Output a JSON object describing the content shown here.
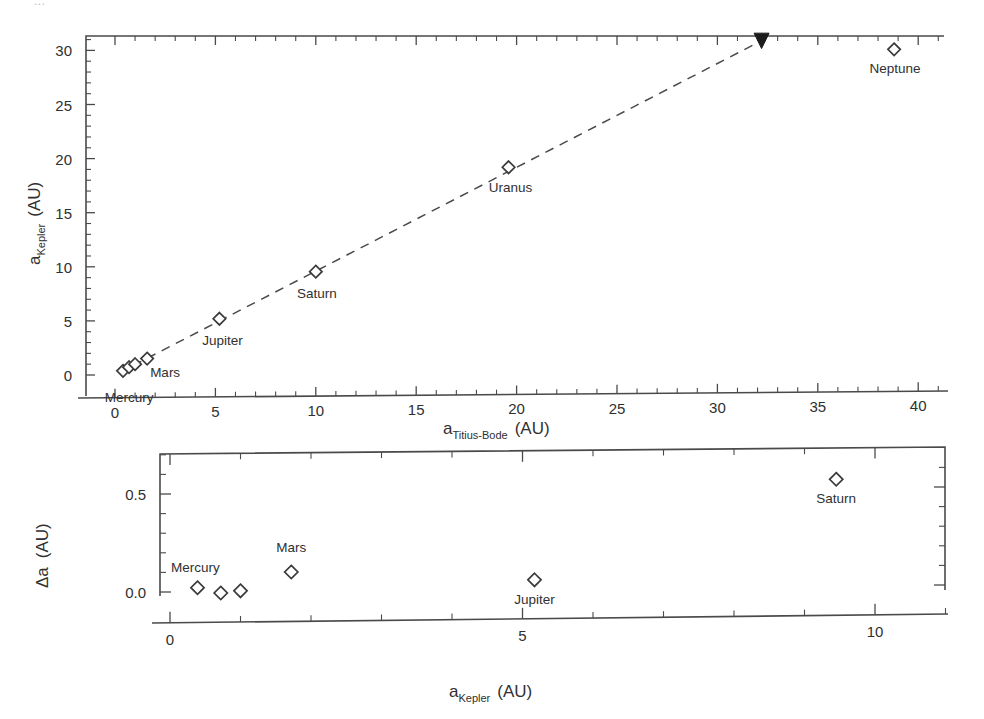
{
  "figure": {
    "scan_bleed_text": "..."
  },
  "chart_data": [
    {
      "panel": "top",
      "type": "scatter",
      "title": "",
      "xlabel": "a_Titius-Bode (AU)",
      "xlabel_base": "a",
      "xlabel_sub": "Titius-Bode",
      "xlabel_unit": "(AU)",
      "ylabel_base": "a",
      "ylabel_sub": "Kepler",
      "ylabel_unit": "(AU)",
      "xlim": [
        -1.5,
        41.5
      ],
      "ylim": [
        -2.0,
        32.5
      ],
      "xticks": [
        0,
        5,
        10,
        15,
        20,
        25,
        30,
        35,
        40
      ],
      "xticklabels": [
        "0",
        "5",
        "10",
        "15",
        "20",
        "25",
        "30",
        "35",
        "40"
      ],
      "yticks": [
        0,
        5,
        10,
        15,
        20,
        25,
        30
      ],
      "yticklabels": [
        "0",
        "5",
        "10",
        "15",
        "20",
        "25",
        "30"
      ],
      "xminor_step": 1,
      "yminor_step": 1,
      "grid": false,
      "legend": "none",
      "points": [
        {
          "label": "Mercury",
          "x": 0.4,
          "y": 0.39,
          "label_pos": "below",
          "label_show": true,
          "label_dx": 6,
          "label_dy": 31
        },
        {
          "label": "Venus",
          "x": 0.7,
          "y": 0.72,
          "label_pos": "none",
          "label_show": false,
          "label_dx": 0,
          "label_dy": 0
        },
        {
          "label": "Earth",
          "x": 1.0,
          "y": 1.0,
          "label_pos": "none",
          "label_show": false,
          "label_dx": 0,
          "label_dy": 0
        },
        {
          "label": "Mars",
          "x": 1.6,
          "y": 1.52,
          "label_pos": "below",
          "label_show": true,
          "label_dx": 18,
          "label_dy": 18
        },
        {
          "label": "Jupiter",
          "x": 5.2,
          "y": 5.2,
          "label_pos": "below",
          "label_show": true,
          "label_dx": 3,
          "label_dy": 26
        },
        {
          "label": "Saturn",
          "x": 10.0,
          "y": 9.55,
          "label_pos": "below",
          "label_show": true,
          "label_dx": 1,
          "label_dy": 26
        },
        {
          "label": "Uranus",
          "x": 19.6,
          "y": 19.2,
          "label_pos": "below",
          "label_show": true,
          "label_dx": 2,
          "label_dy": 25
        },
        {
          "label": "Neptune",
          "x": 38.8,
          "y": 30.1,
          "label_pos": "below",
          "label_show": true,
          "label_dx": 1,
          "label_dy": 24
        }
      ],
      "trend_line": {
        "x0": 0.2,
        "y0": 0.2,
        "x1": 32.2,
        "y1": 30.9,
        "style": "dashed"
      },
      "endpoint_marker": {
        "x": 32.2,
        "y": 30.9,
        "shape": "filled-down-triangle"
      }
    },
    {
      "panel": "bottom",
      "type": "scatter",
      "title": "",
      "xlabel_base": "a",
      "xlabel_sub": "Kepler",
      "xlabel_unit": "(AU)",
      "ylabel_base": "Δa",
      "ylabel_unit": "(AU)",
      "xlim": [
        -1.0,
        11.0
      ],
      "ylim": [
        -0.12,
        0.7
      ],
      "xticks": [
        0,
        5,
        10
      ],
      "xticklabels": [
        "0",
        "5",
        "10"
      ],
      "yticks": [
        0.0,
        0.5
      ],
      "yticklabels": [
        "0.0",
        "0.5"
      ],
      "xminor_step": 1,
      "yminor_step": 0.1,
      "grid": false,
      "legend": "none",
      "points": [
        {
          "label": "Mercury",
          "x": 0.39,
          "y": 0.022,
          "label_show": true,
          "label_pos": "above",
          "label_dx": -2,
          "label_dy": -16
        },
        {
          "label": "Venus",
          "x": 0.72,
          "y": -0.005,
          "label_show": false,
          "label_pos": "none",
          "label_dx": 0,
          "label_dy": 0
        },
        {
          "label": "Earth",
          "x": 1.0,
          "y": 0.006,
          "label_show": false,
          "label_pos": "none",
          "label_dx": 0,
          "label_dy": 0
        },
        {
          "label": "Mars",
          "x": 1.72,
          "y": 0.102,
          "label_show": true,
          "label_pos": "above",
          "label_dx": 0,
          "label_dy": -20
        },
        {
          "label": "Jupiter",
          "x": 5.17,
          "y": 0.062,
          "label_show": true,
          "label_pos": "below",
          "label_dx": 0,
          "label_dy": 24
        },
        {
          "label": "Saturn",
          "x": 9.45,
          "y": 0.575,
          "label_show": true,
          "label_pos": "below",
          "label_dx": 0,
          "label_dy": 24
        }
      ]
    }
  ]
}
